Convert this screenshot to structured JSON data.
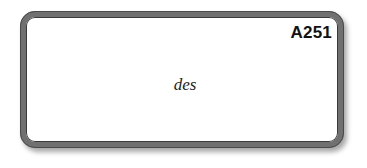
{
  "card": {
    "code": "A251",
    "word": "des",
    "border_color": "#707070",
    "background_color": "#ffffff"
  }
}
